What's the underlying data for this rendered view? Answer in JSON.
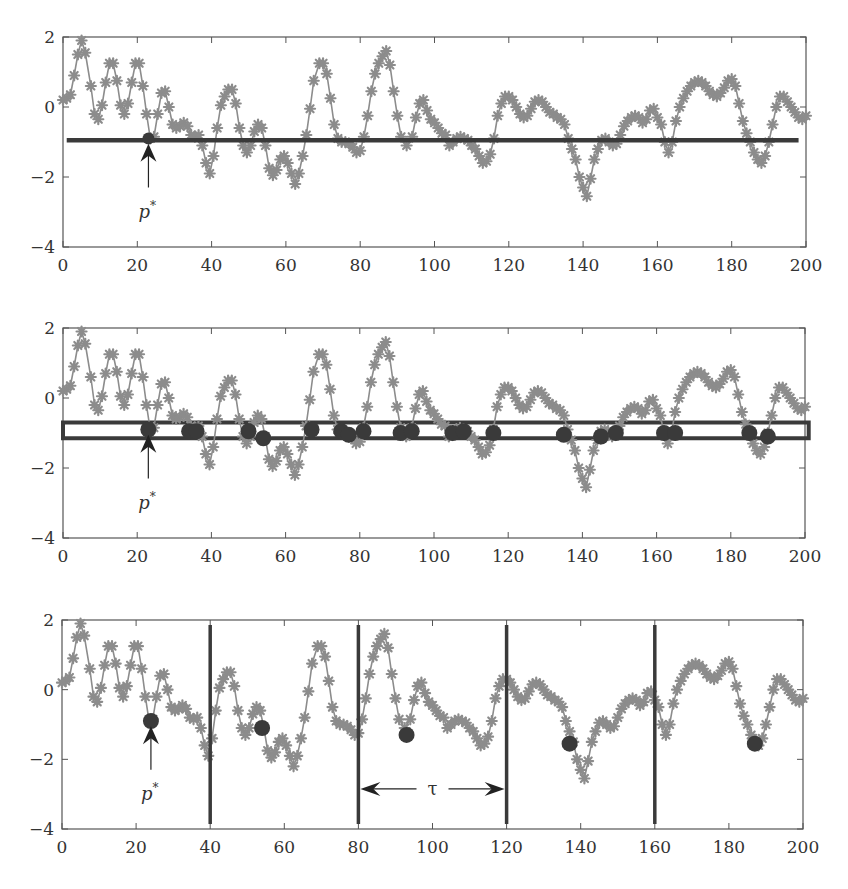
{
  "colors": {
    "series": "#8c8c8c",
    "dark": "#3a3a3a",
    "axis": "#555555",
    "arrow": "#222222"
  },
  "chart_data": [
    {
      "panel": 1,
      "type": "line",
      "title": "",
      "xlabel": "",
      "ylabel": "",
      "xlim": [
        0,
        200
      ],
      "ylim": [
        -4,
        2
      ],
      "xticks": [
        0,
        20,
        40,
        60,
        80,
        100,
        120,
        140,
        160,
        180,
        200
      ],
      "yticks": [
        -4,
        -2,
        0,
        2
      ],
      "grid": false,
      "marker": "asterisk",
      "threshold_line": {
        "y": -0.95,
        "x_from": 1,
        "x_to": 198
      },
      "marked_points": [
        {
          "x": 23,
          "y": -0.9
        }
      ],
      "annotation": {
        "text": "p*",
        "x": 23,
        "arrow_from_y": -2.3,
        "arrow_to_y": -1.05
      }
    },
    {
      "panel": 2,
      "type": "line",
      "xlim": [
        0,
        200
      ],
      "ylim": [
        -4,
        2
      ],
      "xticks": [
        0,
        20,
        40,
        60,
        80,
        100,
        120,
        140,
        160,
        180,
        200
      ],
      "yticks": [
        -4,
        -2,
        0,
        2
      ],
      "grid": false,
      "marker": "asterisk",
      "tolerance_band": {
        "y_low": -1.15,
        "y_high": -0.7,
        "x_from": 0,
        "x_to": 201
      },
      "marked_points": [
        {
          "x": 23,
          "y": -0.9
        },
        {
          "x": 34,
          "y": -0.95
        },
        {
          "x": 36,
          "y": -0.95
        },
        {
          "x": 50,
          "y": -0.95
        },
        {
          "x": 54,
          "y": -1.15
        },
        {
          "x": 67,
          "y": -0.9
        },
        {
          "x": 75,
          "y": -0.95
        },
        {
          "x": 77,
          "y": -1.05
        },
        {
          "x": 81,
          "y": -0.95
        },
        {
          "x": 91,
          "y": -1.0
        },
        {
          "x": 94,
          "y": -0.95
        },
        {
          "x": 105,
          "y": -1.0
        },
        {
          "x": 108,
          "y": -0.95
        },
        {
          "x": 116,
          "y": -1.0
        },
        {
          "x": 135,
          "y": -1.05
        },
        {
          "x": 145,
          "y": -1.1
        },
        {
          "x": 149,
          "y": -1.0
        },
        {
          "x": 162,
          "y": -1.0
        },
        {
          "x": 165,
          "y": -1.0
        },
        {
          "x": 185,
          "y": -1.0
        },
        {
          "x": 190,
          "y": -1.1
        }
      ],
      "annotation": {
        "text": "p*",
        "x": 23,
        "arrow_from_y": -2.3,
        "arrow_to_y": -1.05
      }
    },
    {
      "panel": 3,
      "type": "line",
      "xlim": [
        0,
        200
      ],
      "ylim": [
        -4,
        2
      ],
      "xticks": [
        0,
        20,
        40,
        60,
        80,
        100,
        120,
        140,
        160,
        180,
        200
      ],
      "yticks": [
        -4,
        -2,
        0,
        2
      ],
      "grid": false,
      "marker": "asterisk",
      "segment_boundaries": [
        40,
        80,
        120,
        160
      ],
      "marked_points": [
        {
          "x": 24,
          "y": -0.9
        },
        {
          "x": 54,
          "y": -1.1
        },
        {
          "x": 93,
          "y": -1.3
        },
        {
          "x": 137,
          "y": -1.55
        },
        {
          "x": 187,
          "y": -1.55
        }
      ],
      "annotation": {
        "text": "p*",
        "x": 24,
        "arrow_from_y": -2.3,
        "arrow_to_y": -1.05
      },
      "interval_annotation": {
        "text": "τ",
        "x_from": 80,
        "x_to": 120,
        "y": -2.85
      }
    }
  ],
  "series": [
    [
      0,
      0.2
    ],
    [
      1,
      0.25
    ],
    [
      2,
      0.35
    ],
    [
      3,
      0.9
    ],
    [
      4,
      1.5
    ],
    [
      5,
      1.9
    ],
    [
      6,
      1.55
    ],
    [
      7.5,
      0.6
    ],
    [
      8.5,
      -0.2
    ],
    [
      9.5,
      -0.35
    ],
    [
      10.5,
      0.05
    ],
    [
      11.5,
      0.7
    ],
    [
      12.5,
      1.25
    ],
    [
      13.5,
      1.25
    ],
    [
      14.5,
      0.75
    ],
    [
      15.5,
      0.05
    ],
    [
      16.5,
      -0.2
    ],
    [
      17.5,
      0.1
    ],
    [
      18.5,
      0.7
    ],
    [
      19.5,
      1.25
    ],
    [
      20.5,
      1.25
    ],
    [
      21.5,
      0.6
    ],
    [
      22.5,
      -0.2
    ],
    [
      23.5,
      -0.9
    ],
    [
      24.5,
      -0.85
    ],
    [
      25.5,
      -0.2
    ],
    [
      26.5,
      0.4
    ],
    [
      27.5,
      0.45
    ],
    [
      28.5,
      0.0
    ],
    [
      29.5,
      -0.5
    ],
    [
      30.5,
      -0.6
    ],
    [
      31.5,
      -0.55
    ],
    [
      32.5,
      -0.45
    ],
    [
      33.5,
      -0.55
    ],
    [
      34.5,
      -0.8
    ],
    [
      35.5,
      -0.85
    ],
    [
      36.5,
      -0.8
    ],
    [
      37.5,
      -1.1
    ],
    [
      38.5,
      -1.6
    ],
    [
      39.5,
      -1.9
    ],
    [
      40.5,
      -1.4
    ],
    [
      41.5,
      -0.6
    ],
    [
      42.5,
      0.05
    ],
    [
      43.5,
      0.3
    ],
    [
      44.5,
      0.5
    ],
    [
      45.5,
      0.5
    ],
    [
      46.5,
      0.1
    ],
    [
      47.5,
      -0.6
    ],
    [
      48.5,
      -1.1
    ],
    [
      49.5,
      -1.3
    ],
    [
      50.5,
      -1.1
    ],
    [
      51.5,
      -0.7
    ],
    [
      52.5,
      -0.5
    ],
    [
      53.5,
      -0.6
    ],
    [
      54.5,
      -1.1
    ],
    [
      55.5,
      -1.75
    ],
    [
      56.5,
      -1.95
    ],
    [
      57.5,
      -1.8
    ],
    [
      58.5,
      -1.5
    ],
    [
      59.5,
      -1.4
    ],
    [
      60.5,
      -1.6
    ],
    [
      61.5,
      -1.9
    ],
    [
      62.5,
      -2.2
    ],
    [
      63.5,
      -1.9
    ],
    [
      64.5,
      -1.4
    ],
    [
      65.5,
      -0.8
    ],
    [
      66.5,
      -0.05
    ],
    [
      67.5,
      0.75
    ],
    [
      69,
      1.25
    ],
    [
      70,
      1.25
    ],
    [
      71,
      0.95
    ],
    [
      72,
      0.25
    ],
    [
      73,
      -0.5
    ],
    [
      74,
      -0.9
    ],
    [
      75,
      -1.0
    ],
    [
      76,
      -1.0
    ],
    [
      77,
      -1.05
    ],
    [
      78,
      -1.15
    ],
    [
      79,
      -1.3
    ],
    [
      80,
      -1.25
    ],
    [
      81,
      -0.85
    ],
    [
      82,
      -0.25
    ],
    [
      83,
      0.45
    ],
    [
      84,
      0.95
    ],
    [
      85,
      1.25
    ],
    [
      86,
      1.45
    ],
    [
      87,
      1.6
    ],
    [
      88,
      1.2
    ],
    [
      89,
      0.45
    ],
    [
      90,
      -0.25
    ],
    [
      91,
      -0.85
    ],
    [
      92.5,
      -1.1
    ],
    [
      94,
      -0.85
    ],
    [
      95,
      -0.3
    ],
    [
      96,
      0.1
    ],
    [
      97,
      0.2
    ],
    [
      98,
      -0.1
    ],
    [
      99,
      -0.35
    ],
    [
      100,
      -0.45
    ],
    [
      101,
      -0.6
    ],
    [
      102,
      -0.75
    ],
    [
      103,
      -0.8
    ],
    [
      104,
      -1.1
    ],
    [
      105,
      -1.0
    ],
    [
      106,
      -0.9
    ],
    [
      107,
      -0.85
    ],
    [
      108,
      -0.9
    ],
    [
      109,
      -0.95
    ],
    [
      110,
      -1.1
    ],
    [
      111,
      -1.2
    ],
    [
      112,
      -1.4
    ],
    [
      113,
      -1.6
    ],
    [
      114,
      -1.55
    ],
    [
      115,
      -1.35
    ],
    [
      116,
      -0.9
    ],
    [
      117,
      -0.25
    ],
    [
      118,
      0.1
    ],
    [
      119,
      0.3
    ],
    [
      120,
      0.3
    ],
    [
      121,
      0.2
    ],
    [
      122,
      0.0
    ],
    [
      123,
      -0.2
    ],
    [
      124,
      -0.3
    ],
    [
      125,
      -0.25
    ],
    [
      126,
      -0.05
    ],
    [
      127,
      0.15
    ],
    [
      128,
      0.2
    ],
    [
      129,
      0.15
    ],
    [
      130,
      0.0
    ],
    [
      131,
      -0.15
    ],
    [
      132,
      -0.2
    ],
    [
      133,
      -0.3
    ],
    [
      134,
      -0.35
    ],
    [
      135,
      -0.5
    ],
    [
      136,
      -0.9
    ],
    [
      137,
      -1.2
    ],
    [
      138,
      -1.5
    ],
    [
      139,
      -2.0
    ],
    [
      140,
      -2.3
    ],
    [
      141,
      -2.55
    ],
    [
      142,
      -2.05
    ],
    [
      143,
      -1.5
    ],
    [
      144,
      -1.2
    ],
    [
      145,
      -0.95
    ],
    [
      146,
      -0.9
    ],
    [
      147,
      -1.0
    ],
    [
      148,
      -1.1
    ],
    [
      149,
      -1.05
    ],
    [
      150,
      -0.8
    ],
    [
      151,
      -0.55
    ],
    [
      152,
      -0.4
    ],
    [
      153,
      -0.3
    ],
    [
      154,
      -0.25
    ],
    [
      155,
      -0.3
    ],
    [
      156,
      -0.45
    ],
    [
      157,
      -0.35
    ],
    [
      158,
      -0.1
    ],
    [
      159,
      -0.05
    ],
    [
      160,
      -0.3
    ],
    [
      161,
      -0.5
    ],
    [
      162,
      -1.0
    ],
    [
      163,
      -1.3
    ],
    [
      164,
      -1.0
    ],
    [
      165,
      -0.4
    ],
    [
      166,
      0.0
    ],
    [
      167,
      0.25
    ],
    [
      168,
      0.45
    ],
    [
      169,
      0.6
    ],
    [
      170,
      0.7
    ],
    [
      171,
      0.75
    ],
    [
      172,
      0.7
    ],
    [
      173,
      0.6
    ],
    [
      174,
      0.45
    ],
    [
      175,
      0.35
    ],
    [
      176,
      0.3
    ],
    [
      177,
      0.4
    ],
    [
      178,
      0.55
    ],
    [
      179,
      0.75
    ],
    [
      180,
      0.8
    ],
    [
      181,
      0.6
    ],
    [
      182,
      0.1
    ],
    [
      183,
      -0.4
    ],
    [
      184,
      -0.75
    ],
    [
      185,
      -1.0
    ],
    [
      186,
      -1.3
    ],
    [
      187,
      -1.5
    ],
    [
      188,
      -1.6
    ],
    [
      189,
      -1.4
    ],
    [
      190,
      -1.0
    ],
    [
      191,
      -0.5
    ],
    [
      192,
      0.0
    ],
    [
      193,
      0.3
    ],
    [
      194,
      0.3
    ],
    [
      195,
      0.15
    ],
    [
      196,
      0.0
    ],
    [
      197,
      -0.15
    ],
    [
      198,
      -0.3
    ],
    [
      199,
      -0.35
    ],
    [
      200,
      -0.25
    ]
  ],
  "labels": {
    "p_star": "p",
    "p_star_sup": "*",
    "tau": "τ"
  }
}
